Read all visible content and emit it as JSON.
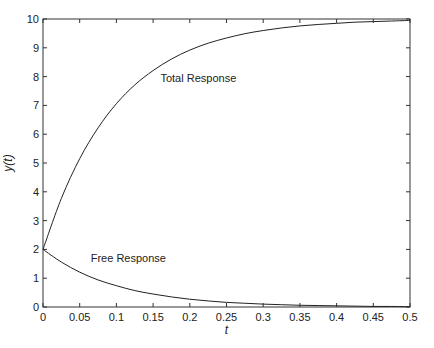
{
  "chart_data": {
    "type": "line",
    "title": "",
    "xlabel": "t",
    "ylabel": "y(t)",
    "xlim": [
      0,
      0.5
    ],
    "ylim": [
      0,
      10
    ],
    "grid": false,
    "legend": "none (inline annotations)",
    "xticks": [
      0,
      0.05,
      0.1,
      0.15,
      0.2,
      0.25,
      0.3,
      0.35,
      0.4,
      0.45,
      0.5
    ],
    "xtick_labels": [
      "0",
      "0.05",
      "0.1",
      "0.15",
      "0.2",
      "0.25",
      "0.3",
      "0.35",
      "0.4",
      "0.45",
      "0.5"
    ],
    "yticks": [
      0,
      1,
      2,
      3,
      4,
      5,
      6,
      7,
      8,
      9,
      10
    ],
    "ytick_labels": [
      "0",
      "1",
      "2",
      "3",
      "4",
      "5",
      "6",
      "7",
      "8",
      "9",
      "10"
    ],
    "x": [
      0,
      0.025,
      0.05,
      0.075,
      0.1,
      0.125,
      0.15,
      0.175,
      0.2,
      0.225,
      0.25,
      0.275,
      0.3,
      0.325,
      0.35,
      0.375,
      0.4,
      0.425,
      0.45,
      0.475,
      0.5
    ],
    "series": [
      {
        "name": "Total Response",
        "values": [
          2.0,
          3.77,
          5.15,
          6.22,
          7.06,
          7.71,
          8.21,
          8.61,
          8.92,
          9.16,
          9.34,
          9.49,
          9.6,
          9.69,
          9.76,
          9.81,
          9.85,
          9.89,
          9.91,
          9.93,
          9.95
        ]
      },
      {
        "name": "Free Response",
        "values": [
          2.0,
          1.56,
          1.21,
          0.94,
          0.74,
          0.57,
          0.45,
          0.35,
          0.27,
          0.21,
          0.16,
          0.13,
          0.1,
          0.08,
          0.06,
          0.05,
          0.04,
          0.03,
          0.02,
          0.02,
          0.01
        ]
      }
    ],
    "annotations": [
      {
        "text": "Total Response",
        "x": 0.16,
        "y": 7.8
      },
      {
        "text": "Free Response",
        "x": 0.065,
        "y": 1.55
      }
    ]
  }
}
